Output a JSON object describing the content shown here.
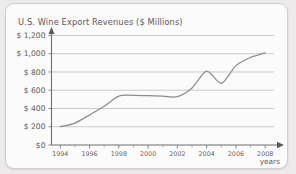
{
  "card": {
    "background_color": "#fbfbfb",
    "border_color": "#cfcfcf",
    "page_background": "#eceaea"
  },
  "chart_data": {
    "type": "line",
    "title": "U.S. Wine Export Revenues ($ Millions)",
    "xlabel": "years",
    "ylabel": "",
    "x": [
      1994,
      1995,
      1996,
      1997,
      1998,
      1999,
      2000,
      2001,
      2002,
      2003,
      2004,
      2005,
      2006,
      2007,
      2008
    ],
    "values": [
      200,
      240,
      330,
      425,
      535,
      545,
      540,
      535,
      530,
      625,
      810,
      675,
      870,
      960,
      1010
    ],
    "xlim": [
      1993.4,
      2008.6
    ],
    "ylim": [
      0,
      1260
    ],
    "xticks": [
      1994,
      1995,
      1996,
      1997,
      1998,
      1999,
      2000,
      2001,
      2002,
      2003,
      2004,
      2005,
      2006,
      2007,
      2008
    ],
    "xtick_labels": [
      "1994",
      "",
      "1996",
      "",
      "1998",
      "",
      "2000",
      "",
      "2002",
      "",
      "2004",
      "",
      "2006",
      "",
      "2008"
    ],
    "yticks": [
      0,
      200,
      400,
      600,
      800,
      1000,
      1200
    ],
    "ytick_labels": [
      "$0",
      "$ 200",
      "$ 400",
      "$ 600",
      "$ 800",
      "$ 1,000",
      "$ 1,200"
    ],
    "grid": "horizontal",
    "legend": "none",
    "line_color": "#8d8d8d",
    "axis_color": "#6f6f6f",
    "grid_color": "#a9a9a9",
    "text_color": "#5e5a5a"
  }
}
